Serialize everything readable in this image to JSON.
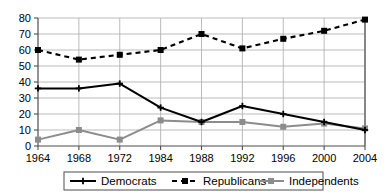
{
  "chart_data": {
    "type": "line",
    "title": "",
    "subtitle": "",
    "xlabel": "",
    "ylabel": "",
    "categories": [
      "1964",
      "1968",
      "1972",
      "1984",
      "1988",
      "1992",
      "1996",
      "2000",
      "2004"
    ],
    "x": [
      1964,
      1968,
      1972,
      1984,
      1988,
      1992,
      1996,
      2000,
      2004
    ],
    "ylim": [
      0,
      80
    ],
    "yticks": [
      0,
      10,
      20,
      30,
      40,
      50,
      60,
      70,
      80
    ],
    "ytick_labels": [
      "0",
      "10",
      "20",
      "30",
      "40",
      "50",
      "60",
      "70",
      "80"
    ],
    "grid": true,
    "legend_position": "bottom",
    "series": [
      {
        "name": "Democrats",
        "values": [
          36,
          36,
          39,
          24,
          15,
          25,
          20,
          15,
          10
        ],
        "color": "#000000",
        "line_style": "solid",
        "marker": "plus"
      },
      {
        "name": "Republicans",
        "values": [
          60,
          54,
          57,
          60,
          70,
          61,
          67,
          72,
          79
        ],
        "color": "#000000",
        "line_style": "dashed",
        "marker": "square"
      },
      {
        "name": "Independents",
        "values": [
          4,
          10,
          4,
          16,
          15,
          15,
          12,
          14,
          11
        ],
        "color": "#8c8c8c",
        "line_style": "solid",
        "marker": "square"
      }
    ]
  },
  "legend": {
    "items": [
      {
        "label": "Democrats"
      },
      {
        "label": "Republicans"
      },
      {
        "label": "Independents"
      }
    ]
  },
  "colors": {
    "democrats": "#000000",
    "republicans": "#000000",
    "independents": "#8c8c8c",
    "grid": "#b3b3b3",
    "axis": "#4d4d4d",
    "background": "#ffffff"
  }
}
